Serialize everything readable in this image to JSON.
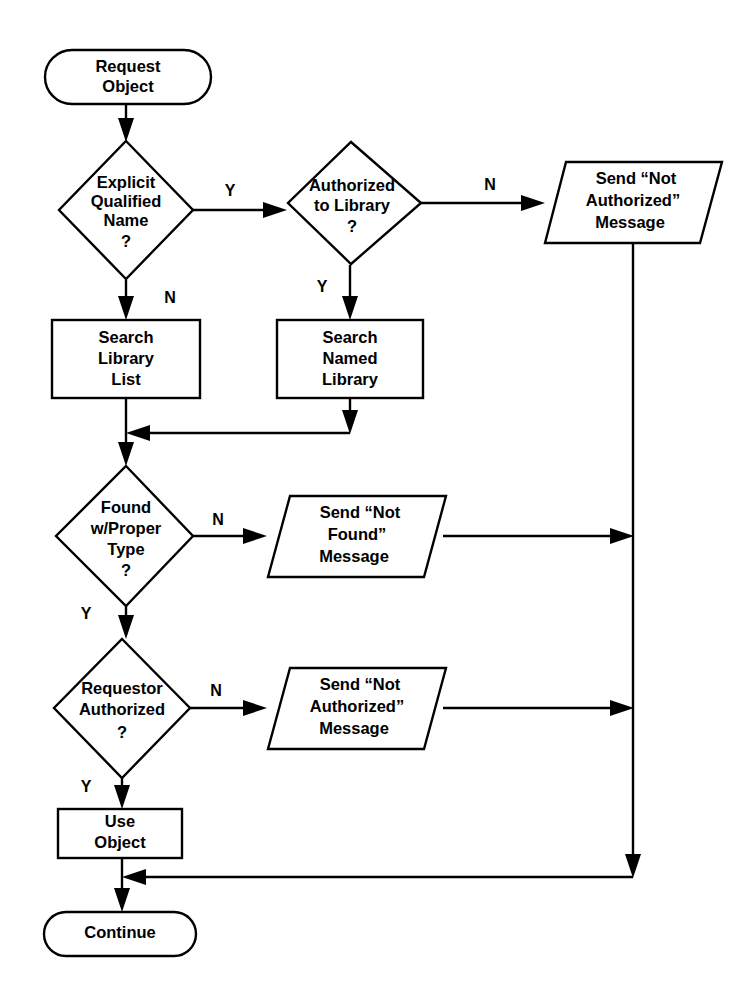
{
  "diagram": {
    "background_color": "#ffffff",
    "line_color": "#000000",
    "text_color": "#000000"
  },
  "nodes": {
    "start": {
      "type": "terminator",
      "line1": "Request",
      "line2": "Object"
    },
    "explicit_qualified_name": {
      "type": "decision",
      "line1": "Explicit",
      "line2": "Qualified",
      "line3": "Name",
      "line4": "?"
    },
    "authorized_to_library": {
      "type": "decision",
      "line1": "Authorized",
      "line2": "to Library",
      "line3": "?"
    },
    "send_not_authorized_top": {
      "type": "io",
      "line1": "Send “Not",
      "line2": "Authorized”",
      "line3": "Message"
    },
    "search_library_list": {
      "type": "process",
      "line1": "Search",
      "line2": "Library",
      "line3": "List"
    },
    "search_named_library": {
      "type": "process",
      "line1": "Search",
      "line2": "Named",
      "line3": "Library"
    },
    "found_with_proper_type": {
      "type": "decision",
      "line1": "Found",
      "line2": "w/Proper",
      "line3": "Type",
      "line4": "?"
    },
    "send_not_found": {
      "type": "io",
      "line1": "Send “Not",
      "line2": "Found”",
      "line3": "Message"
    },
    "requestor_authorized": {
      "type": "decision",
      "line1": "Requestor",
      "line2": "Authorized",
      "line3": "?"
    },
    "send_not_authorized_bottom": {
      "type": "io",
      "line1": "Send “Not",
      "line2": "Authorized”",
      "line3": "Message"
    },
    "use_object": {
      "type": "process",
      "line1": "Use",
      "line2": "Object"
    },
    "end": {
      "type": "terminator",
      "line1": "Continue"
    }
  },
  "edge_labels": {
    "eqn_yes": "Y",
    "eqn_no": "N",
    "atl_no": "N",
    "atl_yes": "Y",
    "found_no": "N",
    "found_yes": "Y",
    "req_no": "N",
    "req_yes": "Y"
  }
}
